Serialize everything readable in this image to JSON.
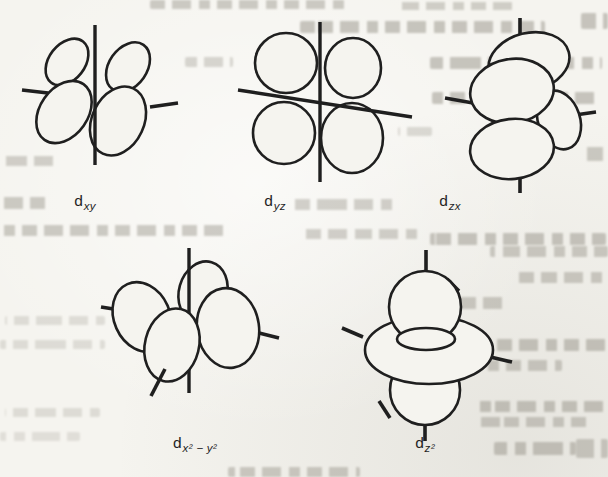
{
  "page": {
    "colors": {
      "paper": "#f5f4ef",
      "ink": "#1f1f1f",
      "bleed_text": "#98948a"
    }
  },
  "figure": {
    "orbitals": [
      {
        "id": "dxy",
        "label_base": "d",
        "label_sub": "xy"
      },
      {
        "id": "dyz",
        "label_base": "d",
        "label_sub": "yz"
      },
      {
        "id": "dzx",
        "label_base": "d",
        "label_sub": "zx"
      },
      {
        "id": "dx2-y2",
        "label_base": "d",
        "label_sub": "x² − y²"
      },
      {
        "id": "dz2",
        "label_base": "d",
        "label_sub": "z²"
      }
    ]
  }
}
